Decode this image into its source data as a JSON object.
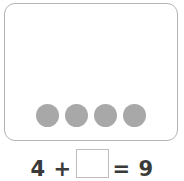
{
  "worksheet": {
    "type": "addition-missing-addend",
    "counter_card": {
      "counter_count": 4,
      "counter_color": "#a8a8a8",
      "border_color": "#b4b4b4",
      "background_color": "#ffffff",
      "counters": [
        {
          "label": "counter-1"
        },
        {
          "label": "counter-2"
        },
        {
          "label": "counter-3"
        },
        {
          "label": "counter-4"
        }
      ]
    },
    "equation": {
      "left_expression": "4 +",
      "first_addend": "4",
      "operator": "+",
      "answer_value": "",
      "answer_placeholder": "",
      "right_expression": "= 9",
      "equals_sign": "=",
      "sum": "9",
      "text_color": "#3a3a3a",
      "box_border_color": "#bcbcbc"
    }
  }
}
